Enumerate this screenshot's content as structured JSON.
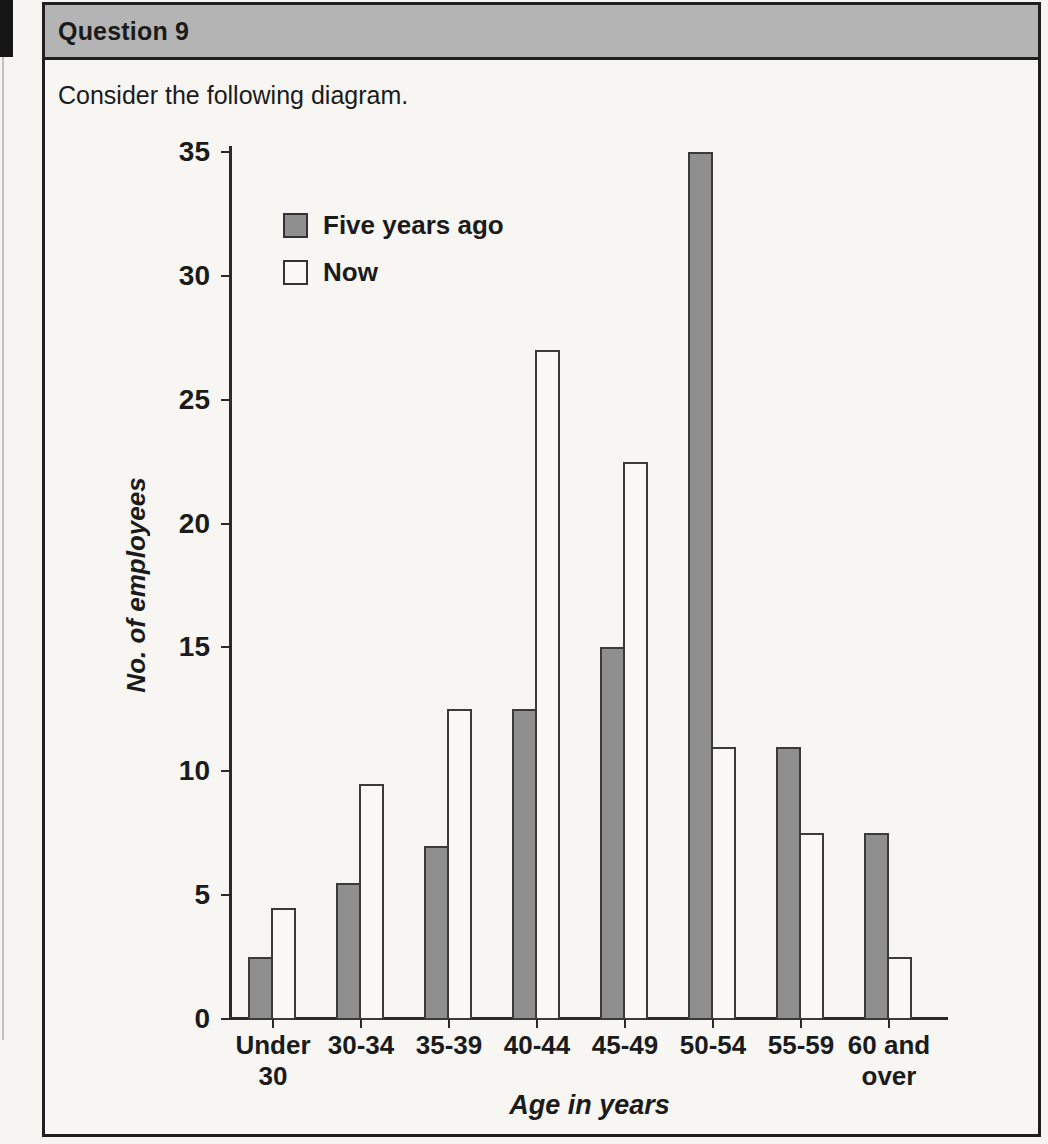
{
  "header": {
    "title": "Question 9"
  },
  "intro": {
    "text": "Consider the following diagram."
  },
  "colors": {
    "header_bg": "#b4b4b4",
    "page_bg": "#f6f5f2",
    "box_border": "#1f1f1f",
    "axis_color": "#2a2a2a",
    "bar_border": "#3a3a3a",
    "bar_five_years_ago_fill": "#8f8f8f",
    "bar_now_fill": "#f9f8f5"
  },
  "chart_data": {
    "type": "bar",
    "title": "",
    "xlabel": "Age in years",
    "ylabel": "No. of employees",
    "ylim": [
      0,
      35
    ],
    "yticks": [
      0,
      5,
      10,
      15,
      20,
      25,
      30,
      35
    ],
    "grid": false,
    "legend_position": "top-left inside plot",
    "categories": [
      "Under 30",
      "30-34",
      "35-39",
      "40-44",
      "45-49",
      "50-54",
      "55-59",
      "60 and over"
    ],
    "category_label_lines": [
      "Under\n30",
      "30-34",
      "35-39",
      "40-44",
      "45-49",
      "50-54",
      "55-59",
      "60 and\nover"
    ],
    "series": [
      {
        "name": "Five years ago",
        "values": [
          2.5,
          5.5,
          7,
          12.5,
          15,
          35,
          11,
          7.5
        ],
        "fill": "#8f8f8f"
      },
      {
        "name": "Now",
        "values": [
          4.5,
          9.5,
          12.5,
          27,
          22.5,
          11,
          7.5,
          2.5
        ],
        "fill": "#f9f8f5"
      }
    ]
  }
}
